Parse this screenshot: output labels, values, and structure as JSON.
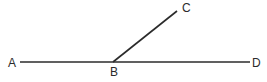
{
  "figure": {
    "name": "angle-diagram",
    "background_color": "#ffffff",
    "stroke_color": "#2b2b2b",
    "label_color": "#2b2b2b",
    "stroke_width": 1.6
  },
  "labels": {
    "A": "A",
    "B": "B",
    "C": "C",
    "D": "D"
  },
  "chart_data": {
    "type": "diagram",
    "title": "",
    "points": [
      {
        "name": "A",
        "x": 20,
        "y": 62,
        "label": "A",
        "label_x": 12,
        "label_y": 63
      },
      {
        "name": "B",
        "x": 113,
        "y": 62,
        "label": "B",
        "label_x": 113,
        "label_y": 72
      },
      {
        "name": "C",
        "x": 177,
        "y": 11,
        "label": "C",
        "label_x": 186,
        "label_y": 8
      },
      {
        "name": "D",
        "x": 250,
        "y": 62,
        "label": "D",
        "label_x": 256,
        "label_y": 63
      }
    ],
    "segments": [
      {
        "name": "segment-AD",
        "from": "A",
        "to": "D",
        "x1": 20,
        "y1": 62,
        "x2": 250,
        "y2": 62
      },
      {
        "name": "segment-BC",
        "from": "B",
        "to": "C",
        "x1": 113,
        "y1": 62,
        "x2": 177,
        "y2": 11
      }
    ]
  }
}
